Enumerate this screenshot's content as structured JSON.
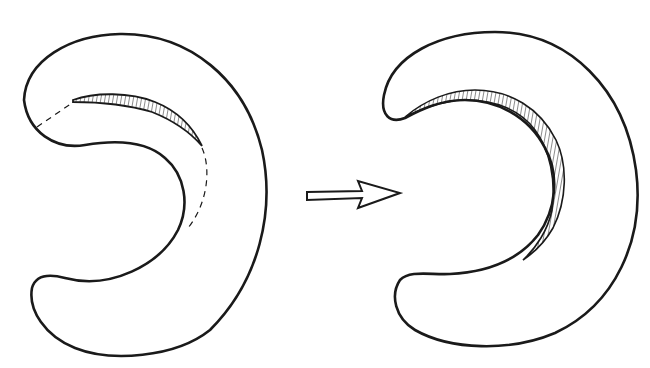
{
  "diagram": {
    "type": "before-after illustration",
    "description": "Two C-shaped kidney-like outlines; the left shows a partially hatched upper inner edge with dashed guide lines, the right shows the hatched band extended along the full inner curvature. A hollow arrow points from left to right.",
    "colors": {
      "stroke": "#1a1a1a",
      "background": "#ffffff"
    },
    "elements": [
      {
        "id": "left-shape",
        "label": "before"
      },
      {
        "id": "arrow",
        "label": "transition-arrow"
      },
      {
        "id": "right-shape",
        "label": "after"
      }
    ]
  }
}
